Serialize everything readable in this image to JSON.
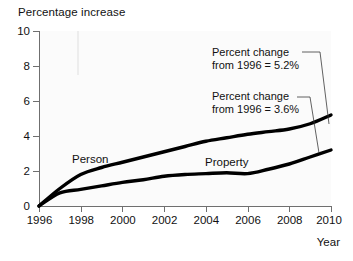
{
  "chart_data": {
    "type": "line",
    "title": "",
    "ylabel": "Percentage increase",
    "xlabel": "Year",
    "x": [
      1996,
      1997,
      1998,
      1999,
      2000,
      2001,
      2002,
      2003,
      2004,
      2005,
      2006,
      2007,
      2008,
      2009,
      2010
    ],
    "xlim": [
      1996,
      2010
    ],
    "ylim": [
      0,
      10
    ],
    "y_ticks": [
      0,
      2,
      4,
      6,
      8,
      10
    ],
    "y_tick_labels": [
      "0",
      "2",
      "4",
      "6",
      "8",
      "10"
    ],
    "x_ticks": [
      1996,
      1998,
      2000,
      2002,
      2004,
      2006,
      2008,
      2010
    ],
    "x_tick_labels": [
      "1996",
      "1998",
      "2000",
      "2002",
      "2004",
      "2006",
      "2008",
      "2010"
    ],
    "grid": false,
    "legend_position": "inline-labels",
    "line_color": "#000000",
    "series": [
      {
        "name": "Person",
        "values": [
          0,
          1.0,
          1.8,
          2.2,
          2.5,
          2.8,
          3.1,
          3.4,
          3.7,
          3.9,
          4.1,
          4.25,
          4.4,
          4.7,
          5.2
        ],
        "end_value": 5.2
      },
      {
        "name": "Property",
        "values": [
          0,
          0.75,
          0.95,
          1.15,
          1.35,
          1.5,
          1.7,
          1.8,
          1.85,
          1.9,
          1.85,
          2.1,
          2.4,
          2.8,
          3.2
        ],
        "end_value": 3.6
      }
    ],
    "annotations": [
      {
        "id": "person-annotation",
        "line1": "Percent change",
        "line2": "from 1996 = 5.2%",
        "target_series": "Person"
      },
      {
        "id": "property-annotation",
        "line1": "Percent change",
        "line2": "from 1996 = 3.6%",
        "target_series": "Property"
      }
    ],
    "series_labels": [
      {
        "text": "Person"
      },
      {
        "text": "Property"
      }
    ]
  },
  "axis": {
    "y_title": "Percentage increase",
    "x_title": "Year",
    "y_labels": [
      "10",
      "8",
      "6",
      "4",
      "2",
      "0"
    ],
    "x_labels": [
      "1996",
      "1998",
      "2000",
      "2002",
      "2004",
      "2006",
      "2008",
      "2010"
    ]
  },
  "annotations": {
    "person": {
      "line1": "Percent change",
      "line2": "from 1996 = 5.2%"
    },
    "property": {
      "line1": "Percent change",
      "line2": "from 1996 = 3.6%"
    }
  },
  "series_labels": {
    "person": "Person",
    "property": "Property"
  }
}
